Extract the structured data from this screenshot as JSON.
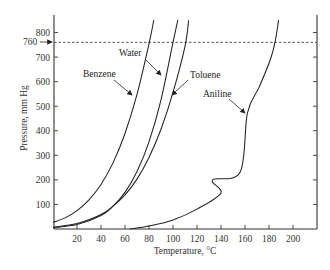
{
  "chart_data": {
    "type": "line",
    "title": "",
    "xlabel": "Temperature, °C",
    "ylabel": "Pressure, mm Hg",
    "xlim": [
      0,
      220
    ],
    "ylim": [
      0,
      850
    ],
    "x_ticks": [
      20,
      40,
      60,
      80,
      100,
      120,
      140,
      160,
      180,
      200
    ],
    "y_ticks": [
      100,
      200,
      300,
      400,
      500,
      600,
      700,
      800
    ],
    "grid": false,
    "reference_line": {
      "value": 760,
      "label": "760",
      "style": "dashed",
      "orientation": "horizontal"
    },
    "series": [
      {
        "name": "Benzene",
        "x": [
          0,
          10,
          20,
          30,
          40,
          50,
          60,
          70,
          80,
          84
        ],
        "y": [
          27,
          45,
          75,
          119,
          181,
          269,
          389,
          548,
          754,
          850
        ]
      },
      {
        "name": "Water",
        "x": [
          0,
          20,
          40,
          50,
          60,
          70,
          80,
          90,
          100,
          104
        ],
        "y": [
          5,
          18,
          55,
          93,
          149,
          234,
          355,
          526,
          760,
          850
        ]
      },
      {
        "name": "Toluene",
        "x": [
          0,
          20,
          40,
          50,
          60,
          70,
          80,
          90,
          100,
          110,
          113
        ],
        "y": [
          7,
          22,
          59,
          93,
          139,
          203,
          291,
          406,
          556,
          744,
          850
        ]
      },
      {
        "name": "Aniline",
        "x": [
          64,
          80,
          100,
          120,
          133,
          140,
          156,
          162,
          172,
          181,
          185,
          188
        ],
        "y": [
          0,
          12,
          37,
          81,
          200,
          147,
          232,
          472,
          580,
          688,
          760,
          850
        ]
      }
    ],
    "annotations": [
      {
        "text": "Benzene",
        "target": "Benzene"
      },
      {
        "text": "Water",
        "target": "Water"
      },
      {
        "text": "Toluene",
        "target": "Toluene"
      },
      {
        "text": "Aniline",
        "target": "Aniline"
      }
    ],
    "legend": "none (inline labels with arrows)"
  },
  "labels": {
    "xlabel": "Temperature, °C",
    "ylabel": "Pressure, mm Hg",
    "ref760": "760",
    "benzene": "Benzene",
    "water": "Water",
    "toluene": "Toluene",
    "aniline": "Aniline"
  }
}
